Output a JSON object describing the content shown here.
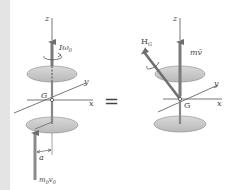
{
  "figure": {
    "left": {
      "axis_z": "z",
      "axis_x": "x",
      "axis_y": "y",
      "center_label": "G",
      "angular_momentum_label": "Iω",
      "angular_momentum_sub": "0",
      "impulse_label": "m",
      "impulse_sub1": "0",
      "impulse_v": "v",
      "impulse_sub2": "0",
      "offset_label": "a"
    },
    "operator": "=",
    "right": {
      "axis_z": "z",
      "axis_x": "x",
      "axis_y": "y",
      "center_label": "G",
      "angular_momentum_label": "H",
      "angular_momentum_sub": "G",
      "linear_momentum_label": "mv̄"
    },
    "colors": {
      "disc_fill": "#c8c8c8",
      "disc_edge": "#8a8a8a",
      "arrow": "#7a7a7a",
      "axis": "#555555",
      "side_strip": "#e4e4e4"
    }
  }
}
